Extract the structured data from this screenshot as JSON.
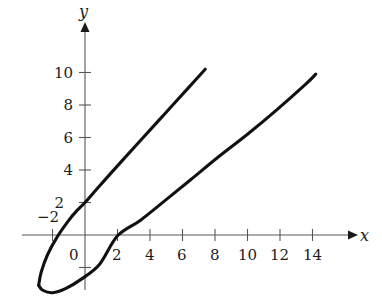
{
  "figure": {
    "background_color": "#ffffff",
    "curve_color": "#111111",
    "axis_color": "#55585a",
    "text_color": "#1c1c1c",
    "x_axis_label": "x",
    "y_axis_label": "y"
  },
  "chart_data": {
    "type": "line",
    "title": "",
    "xlabel": "x",
    "ylabel": "y",
    "grid": false,
    "legend": "none",
    "xlim": [
      -4,
      15.5
    ],
    "ylim": [
      -4,
      12.5
    ],
    "x_ticks": [
      -2,
      0,
      2,
      4,
      6,
      8,
      10,
      12,
      14
    ],
    "x_tick_labels": [
      "−2",
      "0",
      "2",
      "4",
      "6",
      "8",
      "10",
      "12",
      "14"
    ],
    "y_ticks": [
      2,
      4,
      6,
      8,
      10
    ],
    "y_tick_labels": [
      "2",
      "4",
      "6",
      "8",
      "10"
    ],
    "annotations": [],
    "series": [
      {
        "name": "upper-branch",
        "description": "upper branch of sideways parabola, rises steeply from vertex through y-intercept 2",
        "x": [
          -2.85,
          -2.7,
          -2.3,
          -1.7,
          -1.0,
          -0.5,
          0.0,
          0.7,
          1.5,
          2.4,
          3.4,
          4.4,
          5.4,
          6.4,
          7.4
        ],
        "y": [
          -3.1,
          -2.3,
          -1.2,
          -0.1,
          0.9,
          1.5,
          2.0,
          2.8,
          3.7,
          4.7,
          5.8,
          6.9,
          8.0,
          9.1,
          10.2
        ]
      },
      {
        "name": "lower-branch",
        "description": "lower branch of sideways parabola, rises gently from vertex through x-intercept 2",
        "x": [
          -2.85,
          -2.6,
          -2.0,
          -1.2,
          -0.2,
          0.9,
          2.0,
          3.4,
          4.9,
          6.5,
          8.2,
          10.0,
          11.8,
          13.6,
          14.2
        ],
        "y": [
          -3.1,
          -3.4,
          -3.55,
          -3.3,
          -2.7,
          -1.8,
          -0.05,
          0.9,
          2.1,
          3.4,
          4.8,
          6.2,
          7.7,
          9.3,
          9.9
        ]
      }
    ]
  }
}
